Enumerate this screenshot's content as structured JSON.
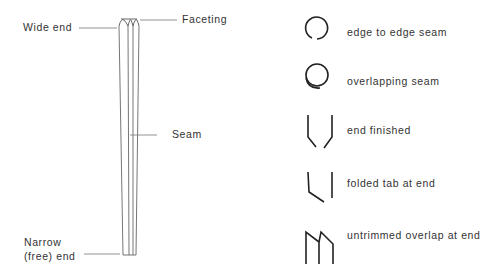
{
  "tube_diagram": {
    "labels": {
      "wide_end": "Wide end",
      "faceting": "Faceting",
      "seam": "Seam",
      "narrow_end_line1": "Narrow",
      "narrow_end_line2": "(free) end"
    }
  },
  "legend": {
    "items": [
      {
        "icon": "edge-to-edge-seam-icon",
        "label": "edge to edge seam"
      },
      {
        "icon": "overlapping-seam-icon",
        "label": "overlapping seam"
      },
      {
        "icon": "end-finished-icon",
        "label": "end finished"
      },
      {
        "icon": "folded-tab-icon",
        "label": "folded tab at end"
      },
      {
        "icon": "untrimmed-overlap-icon",
        "label": "untrimmed overlap at end"
      }
    ]
  },
  "colors": {
    "line": "#555555",
    "icon": "#222222",
    "text": "#333333",
    "background": "#ffffff"
  }
}
